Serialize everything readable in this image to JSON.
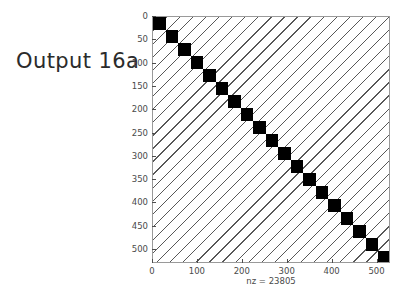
{
  "figure": {
    "title": "Output 16a",
    "background_color": "#ffffff"
  },
  "chart_data": {
    "type": "scatter",
    "plot_kind": "sparsity-pattern",
    "title": "Output 16a",
    "xlabel": "nz = 23805",
    "ylabel": "",
    "nz": 23805,
    "matrix_size": 530,
    "xlim": [
      0,
      530
    ],
    "ylim": [
      530,
      0
    ],
    "grid": false,
    "legend": null,
    "marker_color": "#000000",
    "xticks": [
      0,
      100,
      200,
      300,
      400,
      500
    ],
    "xtick_labels": [
      "0",
      "100",
      "200",
      "300",
      "400",
      "500"
    ],
    "yticks": [
      0,
      50,
      100,
      150,
      200,
      250,
      300,
      350,
      400,
      450,
      500
    ],
    "ytick_labels": [
      "0",
      "50",
      "100",
      "150",
      "200",
      "250",
      "300",
      "350",
      "400",
      "450",
      "500"
    ],
    "structure_description": "Block-diagonal band of 19 dense square blocks along the main diagonal, overlaid on sparse diagonal stripe bands parallel to the main diagonal.",
    "diagonal_blocks": 19,
    "block_size": 28,
    "stripe_count": 36,
    "stripe_direction": "parallel-to-main-diagonal",
    "series": [
      {
        "name": "dense diagonal blocks",
        "block_index": [
          1,
          2,
          3,
          4,
          5,
          6,
          7,
          8,
          9,
          10,
          11,
          12,
          13,
          14,
          15,
          16,
          17,
          18,
          19
        ],
        "block_start": [
          0,
          28,
          56,
          84,
          112,
          140,
          167,
          195,
          223,
          251,
          279,
          307,
          335,
          363,
          390,
          418,
          446,
          474,
          502
        ],
        "block_end": [
          28,
          56,
          84,
          112,
          140,
          167,
          195,
          223,
          251,
          279,
          307,
          335,
          363,
          390,
          418,
          446,
          474,
          502,
          530
        ]
      },
      {
        "name": "sparse off-diagonal stripes",
        "offsets": [
          -480,
          -460,
          -440,
          -420,
          -400,
          -380,
          -360,
          -340,
          -320,
          -300,
          -280,
          -260,
          -240,
          -220,
          -200,
          -180,
          -160,
          -140,
          -120,
          -100,
          -80,
          -60,
          -40,
          -20,
          20,
          40,
          60,
          80,
          100,
          120,
          140,
          160,
          180,
          200,
          220,
          240,
          260,
          280,
          300,
          320,
          340,
          360,
          380,
          400,
          420,
          440,
          460,
          480
        ]
      }
    ]
  },
  "axes": {
    "x_tick_labels": [
      "0",
      "100",
      "200",
      "300",
      "400",
      "500"
    ],
    "y_tick_labels": [
      "0",
      "50",
      "100",
      "150",
      "200",
      "250",
      "300",
      "350",
      "400",
      "450",
      "500"
    ],
    "x_axis_label": "nz = 23805",
    "frame_color": "#9a9a9a",
    "tick_color": "#4a4a4a"
  }
}
